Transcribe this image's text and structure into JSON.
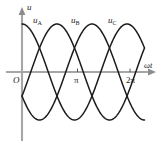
{
  "figure": {
    "background_color": "#ffffff",
    "axis_color": "#a6a6a6",
    "curve_color": "#1c1c1c"
  },
  "axes": {
    "y_axis_label": "u",
    "x_axis_label": "ωt",
    "origin_label": "O",
    "x_ticks": [
      {
        "label": "π",
        "value": 3.14159
      },
      {
        "label": "2π",
        "value": 6.28319
      }
    ]
  },
  "curve_labels": {
    "a_main": "u",
    "a_sub": "A",
    "b_main": "u",
    "b_sub": "B",
    "c_main": "u",
    "c_sub": "C"
  },
  "chart_data": {
    "type": "line",
    "xlabel": "ωt",
    "ylabel": "u",
    "xlim": [
      0,
      7.33
    ],
    "ylim": [
      -1.15,
      1.15
    ],
    "grid": false,
    "legend": "inline-curve-labels",
    "x_tick_values": [
      3.14159,
      6.28319
    ],
    "x_tick_labels": [
      "π",
      "2π"
    ],
    "amplitude": 1,
    "series": [
      {
        "name": "u_A",
        "label": "uA",
        "phase_deg": 90,
        "formula": "u = Um*sin(wt + 90deg)",
        "x": [
          0,
          0.3927,
          0.7854,
          1.1781,
          1.5708,
          1.9635,
          2.3562,
          2.7489,
          3.1416,
          3.5343,
          3.927,
          4.3197,
          4.7124,
          5.1051,
          5.4978,
          5.8905,
          6.2832,
          6.6759,
          7.0686,
          7.33
        ],
        "y": [
          1.0,
          0.924,
          0.707,
          0.383,
          0.0,
          -0.383,
          -0.707,
          -0.924,
          -1.0,
          -0.924,
          -0.707,
          -0.383,
          0.0,
          0.383,
          0.707,
          0.924,
          1.0,
          0.924,
          0.707,
          0.5
        ]
      },
      {
        "name": "u_B",
        "label": "uB",
        "phase_deg": -30,
        "formula": "u = Um*sin(wt - 30deg)",
        "x": [
          0,
          0.3927,
          0.7854,
          1.1781,
          1.5708,
          1.9635,
          2.3562,
          2.7489,
          3.1416,
          3.5343,
          3.927,
          4.3197,
          4.7124,
          5.1051,
          5.4978,
          5.8905,
          6.2832,
          6.6759,
          7.0686,
          7.33
        ],
        "y": [
          -0.5,
          -0.131,
          0.259,
          0.609,
          0.866,
          0.991,
          0.966,
          0.793,
          0.5,
          0.131,
          -0.259,
          -0.609,
          -0.866,
          -0.991,
          -0.966,
          -0.793,
          -0.5,
          -0.131,
          0.259,
          0.5
        ]
      },
      {
        "name": "u_C",
        "label": "uC",
        "phase_deg": -150,
        "formula": "u = Um*sin(wt - 150deg)",
        "x": [
          0,
          0.3927,
          0.7854,
          1.1781,
          1.5708,
          1.9635,
          2.3562,
          2.7489,
          3.1416,
          3.5343,
          3.927,
          4.3197,
          4.7124,
          5.1051,
          5.4978,
          5.8905,
          6.2832,
          6.6759,
          7.0686,
          7.33
        ],
        "y": [
          -0.5,
          -0.793,
          -0.966,
          -0.991,
          -0.866,
          -0.609,
          -0.259,
          0.131,
          0.5,
          0.793,
          0.966,
          0.991,
          0.866,
          0.609,
          0.259,
          -0.131,
          -0.5,
          -0.793,
          -0.966,
          -1.0
        ]
      }
    ]
  }
}
